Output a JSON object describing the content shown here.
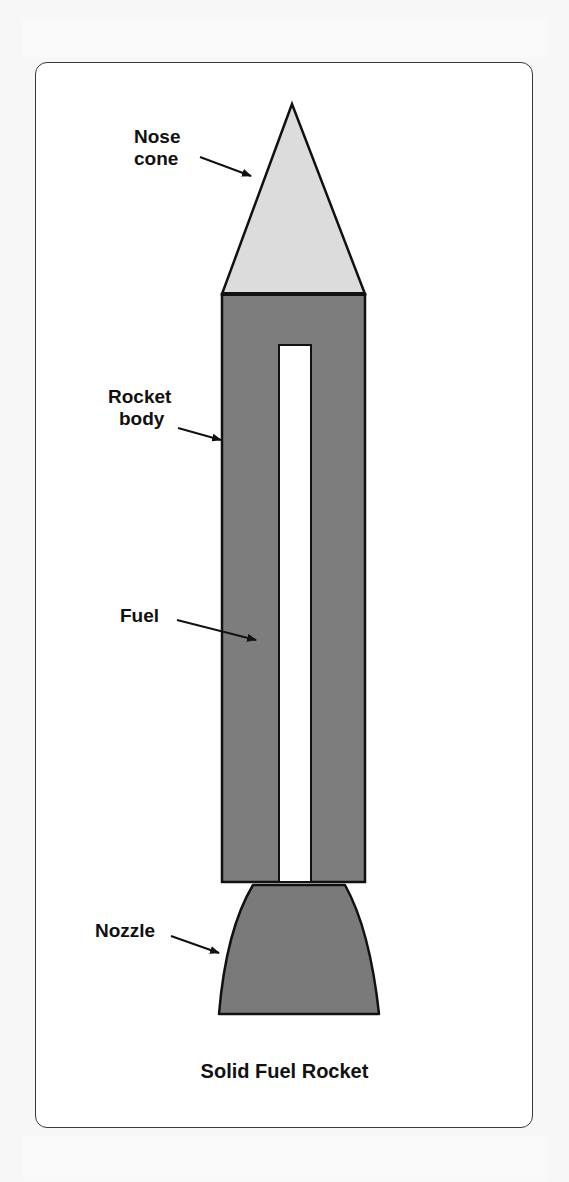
{
  "figure": {
    "title": "Solid Fuel Rocket",
    "labels": {
      "nose_cone": [
        "Nose",
        "cone"
      ],
      "rocket_body": [
        "Rocket",
        "body"
      ],
      "fuel": [
        "Fuel"
      ],
      "nozzle": [
        "Nozzle"
      ]
    },
    "colors": {
      "nose_cone": "#dcdcdc",
      "body": "#7d7d7d",
      "nozzle": "#7a7a7a",
      "core": "#ffffff",
      "outline": "#111111",
      "frame_border": "#3a3a3a",
      "page_bg": "#f7f7f7"
    }
  }
}
